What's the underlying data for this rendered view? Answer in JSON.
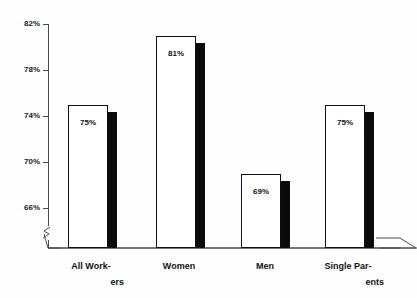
{
  "chart_data": {
    "type": "bar",
    "title": "",
    "subtitle": "",
    "xlabel": "",
    "ylabel": "",
    "categories": [
      "All Workers",
      "Women",
      "Men",
      "Single Parents"
    ],
    "values": [
      75,
      81,
      69,
      75
    ],
    "value_labels": [
      "75%",
      "81%",
      "69%",
      "75%"
    ],
    "ylim": [
      66,
      82
    ],
    "yticks": [
      82,
      78,
      74,
      70,
      66
    ],
    "ytick_labels": [
      "82%",
      "78%",
      "74%",
      "70%",
      "66%"
    ],
    "grid": false,
    "legend": null,
    "axis_break": true,
    "style": {
      "bar_fill": "#ffffff",
      "bar_border": "#111111",
      "bar_shadow": "#0b0b0b",
      "axis_color": "#4a4a4a",
      "text_color": "#111111",
      "background": "#fefefe"
    }
  },
  "axis": {
    "ticks": [
      {
        "label": "82%",
        "value": 82
      },
      {
        "label": "78%",
        "value": 78
      },
      {
        "label": "74%",
        "value": 74
      },
      {
        "label": "70%",
        "value": 70
      },
      {
        "label": "66%",
        "value": 66
      }
    ]
  },
  "bars": [
    {
      "category": "All Workers",
      "value": 75,
      "value_label": "75%",
      "label_line1": "All Work-",
      "label_line2": "ers"
    },
    {
      "category": "Women",
      "value": 81,
      "value_label": "81%",
      "label_line1": "Women",
      "label_line2": ""
    },
    {
      "category": "Men",
      "value": 69,
      "value_label": "69%",
      "label_line1": "Men",
      "label_line2": ""
    },
    {
      "category": "Single Parents",
      "value": 75,
      "value_label": "75%",
      "label_line1": "Single Par-",
      "label_line2": "ents"
    }
  ]
}
